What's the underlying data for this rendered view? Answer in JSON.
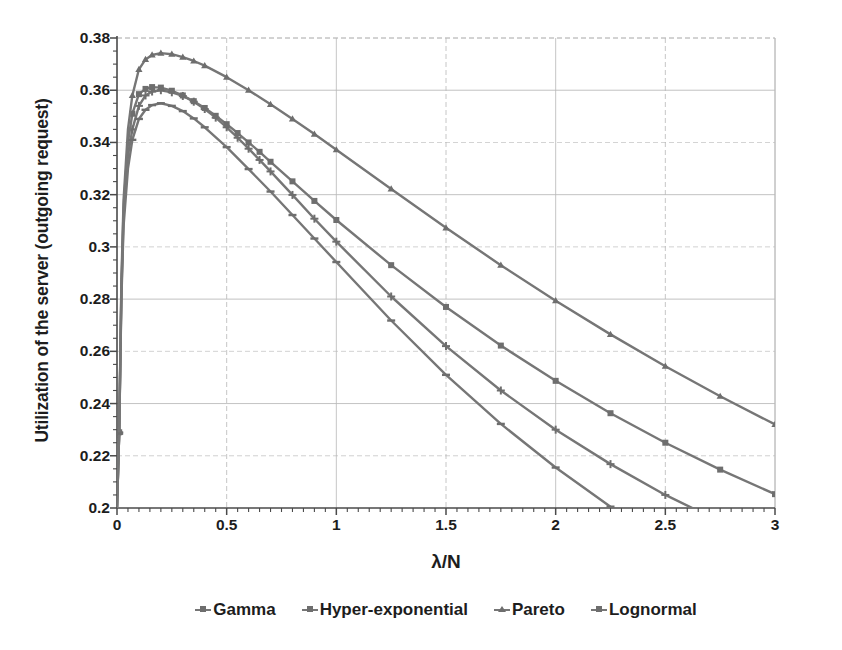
{
  "chart_data": {
    "type": "line",
    "title": "",
    "xlabel": "λ/N",
    "ylabel": "Utilization of the server (outgoing request)",
    "xlim": [
      0,
      3
    ],
    "ylim": [
      0.2,
      0.38
    ],
    "xticks": [
      "0",
      "0.5",
      "1",
      "1.5",
      "2",
      "2.5",
      "3"
    ],
    "xtick_values": [
      0,
      0.5,
      1,
      1.5,
      2,
      2.5,
      3
    ],
    "yticks": [
      "0.2",
      "0.22",
      "0.24",
      "0.26",
      "0.28",
      "0.3",
      "0.32",
      "0.34",
      "0.36",
      "0.38"
    ],
    "ytick_values": [
      0.2,
      0.22,
      0.24,
      0.26,
      0.28,
      0.3,
      0.32,
      0.34,
      0.36,
      0.38
    ],
    "y_minor_step": 0.005,
    "x_minor_step": 0.05,
    "grid": true,
    "legend_position": "bottom",
    "line_color": "#767676",
    "marker_color": "#6e6e6e",
    "axis_color": "#4a4a4a",
    "grid_color": "#b9b9b9",
    "series": [
      {
        "name": "Gamma",
        "marker": "cross",
        "x": [
          0.0,
          0.01,
          0.02,
          0.03,
          0.05,
          0.07,
          0.1,
          0.13,
          0.16,
          0.2,
          0.25,
          0.3,
          0.35,
          0.4,
          0.45,
          0.5,
          0.55,
          0.6,
          0.65,
          0.7,
          0.8,
          0.9,
          1.0,
          1.25,
          1.5,
          1.75,
          2.0,
          2.25,
          2.5,
          2.75,
          3.0
        ],
        "y": [
          0.2,
          0.229,
          0.282,
          0.312,
          0.335,
          0.345,
          0.354,
          0.358,
          0.3595,
          0.36,
          0.3592,
          0.3578,
          0.3556,
          0.3528,
          0.3495,
          0.3458,
          0.3418,
          0.3376,
          0.3333,
          0.3289,
          0.3199,
          0.3108,
          0.302,
          0.281,
          0.262,
          0.245,
          0.23,
          0.2168,
          0.205,
          0.1948,
          0.1855
        ]
      },
      {
        "name": "Hyper-exponential",
        "marker": "square",
        "x": [
          0.0,
          0.01,
          0.02,
          0.03,
          0.05,
          0.07,
          0.1,
          0.13,
          0.16,
          0.2,
          0.25,
          0.3,
          0.35,
          0.4,
          0.45,
          0.5,
          0.55,
          0.6,
          0.65,
          0.7,
          0.8,
          0.9,
          1.0,
          1.25,
          1.5,
          1.75,
          2.0,
          2.25,
          2.5,
          2.75,
          3.0
        ],
        "y": [
          0.2,
          0.229,
          0.284,
          0.315,
          0.34,
          0.351,
          0.3585,
          0.3605,
          0.3612,
          0.361,
          0.3598,
          0.358,
          0.3558,
          0.3532,
          0.3502,
          0.347,
          0.3436,
          0.34,
          0.3364,
          0.3326,
          0.3251,
          0.3176,
          0.3103,
          0.293,
          0.277,
          0.2622,
          0.2487,
          0.2363,
          0.225,
          0.2147,
          0.2053
        ]
      },
      {
        "name": "Pareto",
        "marker": "triangle",
        "x": [
          0.0,
          0.01,
          0.02,
          0.03,
          0.05,
          0.07,
          0.1,
          0.13,
          0.16,
          0.2,
          0.25,
          0.3,
          0.35,
          0.4,
          0.5,
          0.6,
          0.7,
          0.8,
          0.9,
          1.0,
          1.25,
          1.5,
          1.75,
          2.0,
          2.25,
          2.5,
          2.75,
          3.0
        ],
        "y": [
          0.2,
          0.229,
          0.287,
          0.318,
          0.345,
          0.358,
          0.368,
          0.3718,
          0.3735,
          0.3742,
          0.3738,
          0.3727,
          0.3712,
          0.3694,
          0.365,
          0.36,
          0.3546,
          0.349,
          0.3432,
          0.3372,
          0.3222,
          0.3073,
          0.293,
          0.2794,
          0.2665,
          0.2543,
          0.2428,
          0.232
        ]
      },
      {
        "name": "Lognormal",
        "marker": "line",
        "x": [
          0.0,
          0.01,
          0.02,
          0.03,
          0.05,
          0.07,
          0.1,
          0.13,
          0.16,
          0.2,
          0.25,
          0.3,
          0.35,
          0.4,
          0.5,
          0.6,
          0.7,
          0.8,
          0.9,
          1.0,
          1.25,
          1.5,
          1.75,
          2.0,
          2.25,
          2.5,
          2.75,
          3.0
        ],
        "y": [
          0.2,
          0.2285,
          0.28,
          0.308,
          0.33,
          0.341,
          0.349,
          0.3525,
          0.3543,
          0.355,
          0.354,
          0.352,
          0.3492,
          0.3458,
          0.3382,
          0.3298,
          0.3212,
          0.3122,
          0.3032,
          0.2942,
          0.2718,
          0.251,
          0.2322,
          0.2155,
          0.2005,
          0.1875,
          0.1757,
          0.165
        ]
      }
    ],
    "legend_entries": [
      {
        "label": "Gamma",
        "marker": "cross"
      },
      {
        "label": "Hyper-exponential",
        "marker": "square"
      },
      {
        "label": "Pareto",
        "marker": "triangle"
      },
      {
        "label": "Lognormal",
        "marker": "line"
      }
    ]
  }
}
